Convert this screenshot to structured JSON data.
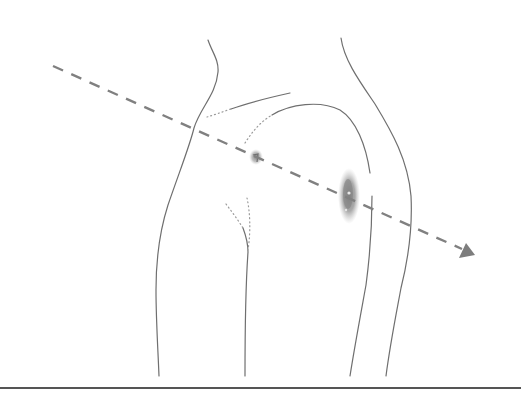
{
  "figure": {
    "colors": {
      "background": "#ffffff",
      "outline": "#6f6f6f",
      "dotted_outline": "#9a9a9a",
      "trajectory": "#808080",
      "wound": "#8a8a8a",
      "ground_line": "#555555"
    },
    "trajectory": {
      "start": [
        53,
        66
      ],
      "end": [
        470,
        254
      ],
      "style": "dashed",
      "arrowhead": "triangle"
    },
    "wounds": [
      {
        "name": "entry-wound",
        "center": [
          256,
          158
        ],
        "size": "small"
      },
      {
        "name": "exit-wound",
        "center": [
          349,
          196
        ],
        "size": "large"
      }
    ],
    "ground_line_y": 388
  }
}
